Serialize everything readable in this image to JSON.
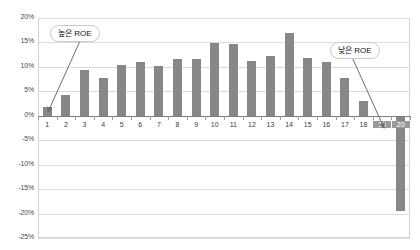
{
  "chart_data": {
    "type": "bar",
    "title": "",
    "subtitle": "",
    "xlabel": "",
    "ylabel": "",
    "categories": [
      "1",
      "2",
      "3",
      "4",
      "5",
      "6",
      "7",
      "8",
      "9",
      "10",
      "11",
      "12",
      "13",
      "14",
      "15",
      "16",
      "17",
      "18",
      "19",
      "20"
    ],
    "values": [
      1.7,
      4.3,
      9.3,
      7.7,
      10.3,
      11.0,
      10.1,
      11.6,
      11.6,
      14.8,
      14.7,
      11.2,
      12.2,
      17.0,
      11.8,
      11.0,
      7.7,
      3.0,
      0.0,
      -19.5
    ],
    "series": [
      {
        "name": "ROE",
        "values": [
          1.7,
          4.3,
          9.3,
          7.7,
          10.3,
          11.0,
          10.1,
          11.6,
          11.6,
          14.8,
          14.7,
          11.2,
          12.2,
          17.0,
          11.8,
          11.0,
          7.7,
          3.0,
          0.0,
          -19.5
        ]
      }
    ],
    "ylim": [
      -25,
      20
    ],
    "ytick_values": [
      20,
      15,
      10,
      5,
      0,
      -5,
      -10,
      -15,
      -20,
      -25
    ],
    "ytick_labels": [
      "20%",
      "15%",
      "10%",
      "5%",
      "0%",
      "-5%",
      "-10%",
      "-15%",
      "-20%",
      "-25%"
    ],
    "grid": true,
    "legend": "none",
    "bar_color": "#878787",
    "grid_color": "#dcdcdc",
    "axis_color": "#7b7b7b",
    "highlighted_categories": [
      "19",
      "20"
    ],
    "annotations": [
      {
        "id": "high-roe",
        "label": "높은 ROE",
        "points_to_category": "1",
        "box_left": 50,
        "box_top": 25,
        "arrow": {
          "x1": 80,
          "y1": 41,
          "x2": 48,
          "y2": 112
        }
      },
      {
        "id": "low-roe",
        "label": "낮은 ROE",
        "points_to_category": "20",
        "box_left": 330,
        "box_top": 42,
        "arrow": {
          "x1": 352,
          "y1": 57,
          "x2": 384,
          "y2": 128
        }
      }
    ]
  }
}
